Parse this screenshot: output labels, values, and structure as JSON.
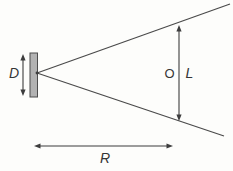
{
  "figure": {
    "labels": {
      "diameter": "D",
      "object": "O",
      "length": "L",
      "range": "R"
    },
    "colors": {
      "background": "#fdfdfb",
      "line": "#4a4a4a",
      "slab_fill": "#b2b2b2",
      "slab_stroke": "#4d4d4d",
      "text": "#353535"
    }
  }
}
